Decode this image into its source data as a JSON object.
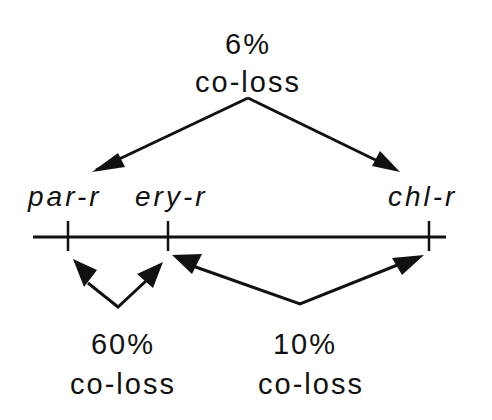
{
  "diagram": {
    "genes": [
      {
        "name": "par-r",
        "position_x": 68
      },
      {
        "name": "ery-r",
        "position_x": 168
      },
      {
        "name": "chl-r",
        "position_x": 429
      }
    ],
    "colocations": [
      {
        "id": "top",
        "percent": "6%",
        "label": "co-loss",
        "between": [
          "par-r/ery-r",
          "chl-r"
        ]
      },
      {
        "id": "lower-left",
        "percent": "60%",
        "label": "co-loss",
        "between": [
          "par-r",
          "ery-r"
        ]
      },
      {
        "id": "lower-right",
        "percent": "10%",
        "label": "co-loss",
        "between": [
          "ery-r",
          "chl-r"
        ]
      }
    ],
    "colors": {
      "ink": "#111111",
      "background": "#ffffff"
    }
  }
}
